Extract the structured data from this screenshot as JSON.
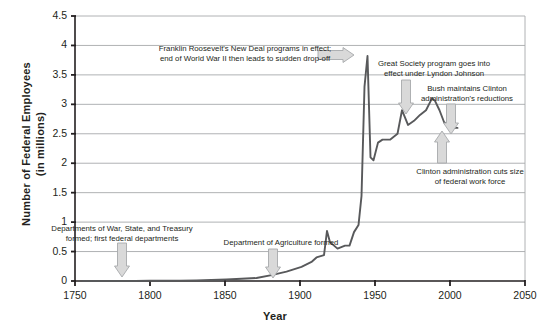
{
  "chart_data": {
    "type": "line",
    "title": "",
    "xlabel": "Year",
    "ylabel": "Number of Federal Employees\n(in millions)",
    "ylabel_line1": "Number of Federal Employees",
    "ylabel_line2": "(in millions)",
    "xlim": [
      1750,
      2050
    ],
    "ylim": [
      0,
      4.5
    ],
    "xticks": [
      1750,
      1800,
      1850,
      1900,
      1950,
      2000,
      2050
    ],
    "yticks": [
      0,
      0.5,
      1,
      1.5,
      2,
      2.5,
      3,
      3.5,
      4,
      4.5
    ],
    "xtick_labels": [
      "1750",
      "1800",
      "1850",
      "1900",
      "1950",
      "2000",
      "2050"
    ],
    "ytick_labels": [
      "0",
      "0.5",
      "1",
      "1.5",
      "2",
      "2.5",
      "3",
      "3.5",
      "4",
      "4.5"
    ],
    "grid": "horizontal",
    "legend": "none",
    "series": [
      {
        "name": "Number of Federal Employees (in millions)",
        "color": "#58595b",
        "x": [
          1755,
          1790,
          1800,
          1810,
          1820,
          1831,
          1841,
          1851,
          1861,
          1871,
          1881,
          1891,
          1901,
          1908,
          1911,
          1916,
          1918,
          1920,
          1925,
          1930,
          1933,
          1936,
          1939,
          1941,
          1943,
          1945,
          1947,
          1949,
          1952,
          1955,
          1960,
          1965,
          1968,
          1972,
          1976,
          1980,
          1984,
          1988,
          1990,
          1993,
          1996,
          1999,
          2002,
          2005
        ],
        "y": [
          0.0,
          0.0,
          0.003,
          0.004,
          0.007,
          0.011,
          0.018,
          0.026,
          0.037,
          0.051,
          0.1,
          0.16,
          0.24,
          0.33,
          0.4,
          0.44,
          0.85,
          0.66,
          0.55,
          0.6,
          0.6,
          0.83,
          0.95,
          1.44,
          3.3,
          3.82,
          2.1,
          2.05,
          2.35,
          2.4,
          2.4,
          2.5,
          2.9,
          2.65,
          2.72,
          2.82,
          2.9,
          3.1,
          3.06,
          2.9,
          2.7,
          2.62,
          2.6,
          2.6
        ]
      }
    ],
    "annotations": [
      {
        "id": "first-departments",
        "text": "Departments of War, State, and Treasury\nformed; first federal departments",
        "text_x": 122,
        "text_y": 224,
        "text_width": 150,
        "arrow": "down",
        "arrow_x": 122,
        "arrow_y": 243,
        "arrow_length": 34
      },
      {
        "id": "dept-agriculture",
        "text": "Department of Agriculture formed",
        "text_x": 281,
        "text_y": 238,
        "text_width": 140,
        "arrow": "down",
        "arrow_x": 273,
        "arrow_y": 249,
        "arrow_length": 29
      },
      {
        "id": "new-deal-wwii",
        "text": "Franklin Roosevelt's New Deal programs in effect;\nend of World War II then leads to sudden drop-off",
        "text_x": 245,
        "text_y": 44,
        "text_width": 215,
        "arrow": "right",
        "arrow_x": 318,
        "arrow_y": 55,
        "arrow_length": 36
      },
      {
        "id": "great-society",
        "text": "Great Society program goes into\neffect under Lyndon Johnson",
        "text_x": 434,
        "text_y": 59,
        "text_width": 140,
        "arrow": "down",
        "arrow_x": 406,
        "arrow_y": 80,
        "arrow_length": 34
      },
      {
        "id": "bush-maintains",
        "text": "Bush maintains Clinton\nadministration's reductions",
        "text_x": 467,
        "text_y": 84,
        "text_width": 120,
        "arrow": "down",
        "arrow_x": 451,
        "arrow_y": 104,
        "arrow_length": 30
      },
      {
        "id": "clinton-cuts",
        "text": "Clinton administration cuts size\nof federal work force",
        "text_x": 470,
        "text_y": 167,
        "text_width": 140,
        "arrow": "up",
        "arrow_x": 442,
        "arrow_y": 131,
        "arrow_length": 32
      }
    ],
    "colors": {
      "line": "#58595b",
      "axis": "#231f20",
      "grid": "#a7a9ac",
      "annotation_fill": "#d9d9d9",
      "annotation_stroke": "#a7a9ac",
      "text": "#231f20",
      "background": "#ffffff"
    }
  }
}
